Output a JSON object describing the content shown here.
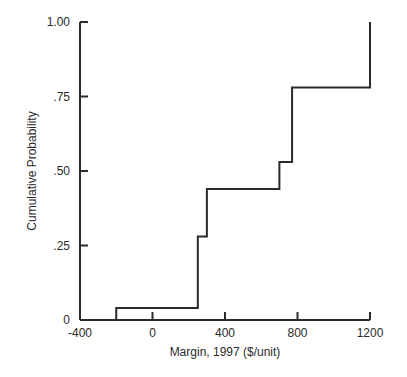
{
  "chart_data": {
    "type": "line",
    "subtype": "step-cumulative",
    "title": "",
    "xlabel": "Margin, 1997 ($/unit)",
    "ylabel": "Cumulative Probability",
    "xlim": [
      -400,
      1200
    ],
    "ylim": [
      0,
      1.0
    ],
    "x_ticks": [
      -400,
      0,
      400,
      800,
      1200
    ],
    "x_tick_labels": [
      "-400",
      "0",
      "400",
      "800",
      "1200"
    ],
    "y_ticks": [
      0,
      0.25,
      0.5,
      0.75,
      1.0
    ],
    "y_tick_labels": [
      "0",
      ".25",
      ".50",
      ".75",
      "1.00"
    ],
    "grid": false,
    "legend": null,
    "series": [
      {
        "name": "Cumulative Probability",
        "x": [
          -200,
          250,
          300,
          700,
          770,
          1200
        ],
        "y": [
          0.04,
          0.28,
          0.44,
          0.53,
          0.78,
          1.0
        ]
      }
    ],
    "line_color": "#2a2a2a"
  }
}
